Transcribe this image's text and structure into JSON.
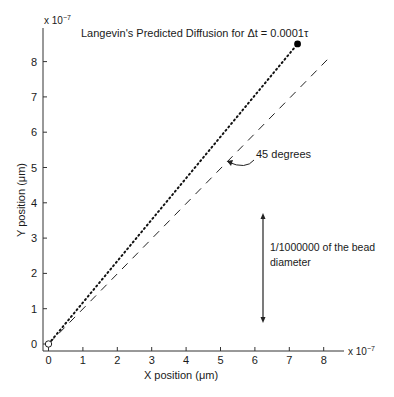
{
  "chart_data": {
    "type": "line",
    "title": "Langevin's Predicted Diffusion for Δt = 0.0001τ",
    "xlabel": "X position (μm)",
    "ylabel": "Y position (μm)",
    "x_multiplier": "x 10",
    "x_exponent": "−7",
    "y_multiplier": "x 10",
    "y_exponent": "−7",
    "xlim": [
      0,
      8.5
    ],
    "ylim": [
      0,
      8.9
    ],
    "x_ticks": [
      "0",
      "1",
      "2",
      "3",
      "4",
      "5",
      "6",
      "7",
      "8"
    ],
    "y_ticks": [
      "0",
      "1",
      "2",
      "3",
      "4",
      "5",
      "6",
      "7",
      "8"
    ],
    "grid": false,
    "series": [
      {
        "name": "Predicted diffusion path",
        "style": "dotted",
        "x": [
          0,
          7.24
        ],
        "y": [
          0,
          8.5
        ],
        "start_marker": "open-circle",
        "end_marker": "filled-circle"
      },
      {
        "name": "45 degree reference",
        "style": "dashed",
        "x": [
          0,
          8.2
        ],
        "y": [
          0,
          8.15
        ]
      }
    ],
    "annotations": [
      {
        "text": "45 degrees",
        "type": "curved-arrow",
        "points_to": [
          5.1,
          5.0
        ]
      },
      {
        "text_lines": [
          "1/1000000 of the bead",
          "diameter"
        ],
        "type": "double-arrow-vertical",
        "x": 6.25,
        "y_range": [
          0.6,
          3.7
        ]
      }
    ]
  }
}
